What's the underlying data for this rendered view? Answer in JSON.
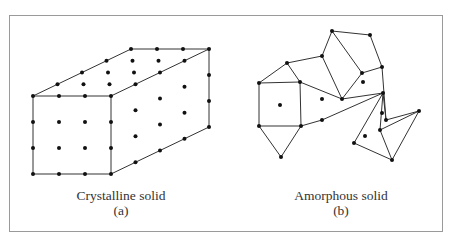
{
  "figure": {
    "panel_a": {
      "caption": "Crystalline solid",
      "label": "(a)",
      "lattice": {
        "origin": [
          33,
          96
        ],
        "u": [
          26,
          0
        ],
        "d": [
          24.5,
          -11.75
        ],
        "v": [
          0,
          26
        ],
        "nu": 4,
        "nd": 5,
        "nv": 4
      }
    },
    "panel_b": {
      "caption": "Amorphous solid",
      "label": "(b)",
      "points": [
        [
          259,
          83
        ],
        [
          287,
          63
        ],
        [
          300,
          82
        ],
        [
          259,
          126
        ],
        [
          301,
          126
        ],
        [
          281,
          157
        ],
        [
          322,
          56
        ],
        [
          342,
          99
        ],
        [
          362,
          73
        ],
        [
          332,
          31
        ],
        [
          370,
          35
        ],
        [
          382,
          67
        ],
        [
          383,
          93
        ],
        [
          386,
          120
        ],
        [
          419,
          111
        ],
        [
          380,
          130
        ],
        [
          392,
          160
        ],
        [
          354,
          143
        ],
        [
          322,
          120
        ]
      ],
      "center_dots": [
        [
          280,
          105
        ],
        [
          322,
          99
        ],
        [
          363,
          82
        ],
        [
          382,
          113
        ],
        [
          365,
          136
        ]
      ],
      "edges": [
        [
          0,
          1
        ],
        [
          1,
          2
        ],
        [
          0,
          2
        ],
        [
          0,
          3
        ],
        [
          2,
          4
        ],
        [
          3,
          4
        ],
        [
          3,
          5
        ],
        [
          4,
          5
        ],
        [
          1,
          6
        ],
        [
          6,
          7
        ],
        [
          2,
          7
        ],
        [
          7,
          12
        ],
        [
          4,
          18
        ],
        [
          18,
          12
        ],
        [
          6,
          9
        ],
        [
          9,
          8
        ],
        [
          8,
          7
        ],
        [
          9,
          10
        ],
        [
          10,
          11
        ],
        [
          8,
          11
        ],
        [
          11,
          13
        ],
        [
          13,
          12
        ],
        [
          13,
          14
        ],
        [
          12,
          15
        ],
        [
          15,
          14
        ],
        [
          14,
          16
        ],
        [
          15,
          16
        ],
        [
          12,
          17
        ],
        [
          17,
          16
        ]
      ]
    },
    "colors": {
      "line": "#333333",
      "dot": "#111111",
      "frame": "#9a9a9a"
    }
  }
}
